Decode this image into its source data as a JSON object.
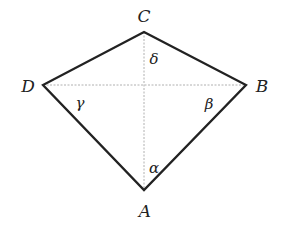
{
  "diagram": {
    "vertices": {
      "A": {
        "label": "A",
        "x": 144,
        "y": 190
      },
      "B": {
        "label": "B",
        "x": 246,
        "y": 85
      },
      "C": {
        "label": "C",
        "x": 144,
        "y": 32
      },
      "D": {
        "label": "D",
        "x": 43,
        "y": 85
      }
    },
    "angles": {
      "alpha": "α",
      "beta": "β",
      "gamma": "γ",
      "delta": "δ"
    },
    "colors": {
      "edge": "#222222",
      "diagonal": "#aaaaaa"
    }
  }
}
